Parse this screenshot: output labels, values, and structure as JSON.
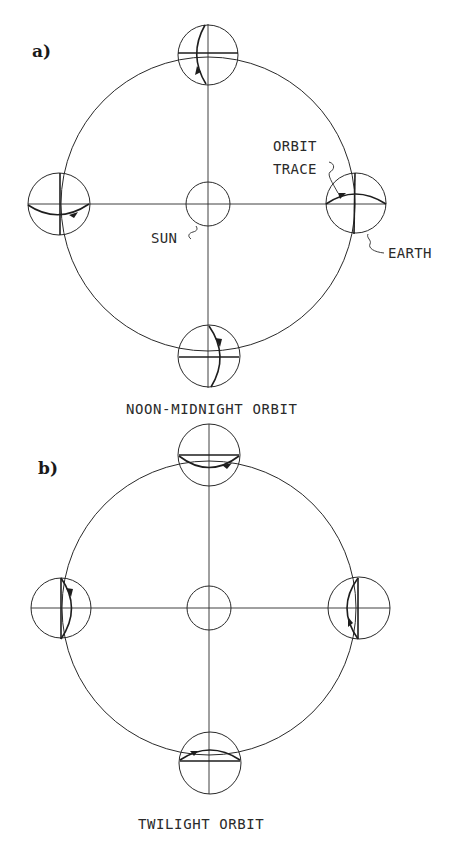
{
  "figure": {
    "panels": [
      {
        "id": "a",
        "label": "a)",
        "title": "NOON-MIDNIGHT ORBIT",
        "labels": {
          "sun": "SUN",
          "orbit_trace_line1": "ORBIT",
          "orbit_trace_line2": "TRACE",
          "earth": "EARTH"
        },
        "earth_positions": [
          "top",
          "left",
          "right",
          "bottom"
        ]
      },
      {
        "id": "b",
        "label": "b)",
        "title": "TWILIGHT ORBIT",
        "earth_positions": [
          "top",
          "left",
          "right",
          "bottom"
        ]
      }
    ],
    "colors": {
      "line": "#2a2a2a",
      "background": "#ffffff"
    }
  }
}
